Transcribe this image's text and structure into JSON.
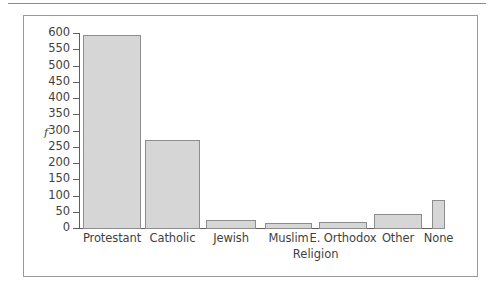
{
  "chart_data": {
    "type": "bar",
    "title": "",
    "subtitle": "",
    "xlabel": "Religion",
    "ylabel": "f",
    "categories": [
      "Protestant",
      "Catholic",
      "Jewish",
      "Muslim",
      "E. Orthodox",
      "Other",
      "None"
    ],
    "values": [
      595,
      270,
      24,
      16,
      18,
      42,
      85
    ],
    "ylim": [
      0,
      600
    ],
    "ytick_labels": [
      "600",
      "550",
      "500",
      "450",
      "400",
      "350",
      "300",
      "250",
      "200",
      "150",
      "100",
      "50",
      "0"
    ],
    "ytick_values": [
      600,
      550,
      500,
      450,
      400,
      350,
      300,
      250,
      200,
      150,
      100,
      50,
      0
    ],
    "grid": false,
    "legend": null,
    "bar_color": "#d6d6d6",
    "bar_border_color": "#8d8d8d",
    "axis_color": "#5f5f5f",
    "frame_color": "#9a9a9a"
  }
}
